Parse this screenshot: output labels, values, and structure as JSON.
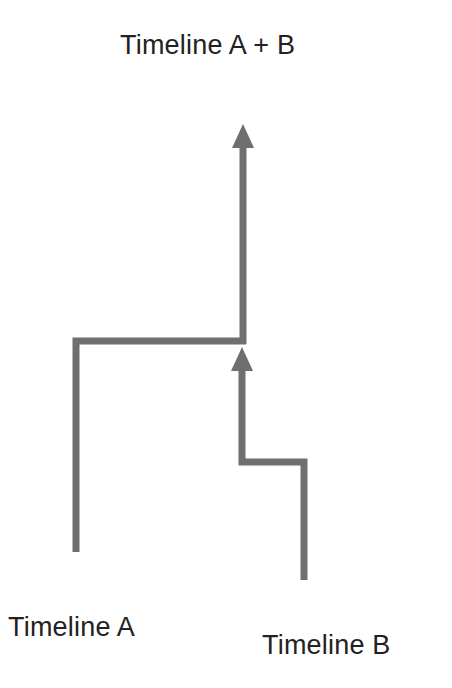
{
  "diagram": {
    "title": "Timeline A + B",
    "timelines": [
      {
        "id": "A",
        "label": "Timeline A"
      },
      {
        "id": "B",
        "label": "Timeline B"
      }
    ],
    "merged_label": "Timeline A + B",
    "colors": {
      "line": "#6f6f6f",
      "text": "#222222",
      "background": "#ffffff"
    }
  }
}
